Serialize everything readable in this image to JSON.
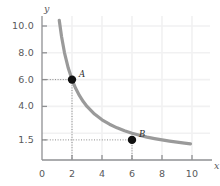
{
  "chart_data": {
    "type": "line",
    "title": "",
    "subtitle": "",
    "xlabel": "x",
    "ylabel": "y",
    "xlim": [
      0,
      10
    ],
    "ylim": [
      0,
      10.6
    ],
    "grid": true,
    "legend": "none",
    "curve": {
      "name": "hyperbola",
      "equation": "y = 12 / x",
      "color": "#9a9a9a",
      "width": 3.2,
      "x_start": 1.15,
      "x_end": 9.9,
      "points_x": [
        1.15,
        1.3,
        1.5,
        1.75,
        2.0,
        2.25,
        2.5,
        2.75,
        3.0,
        3.5,
        4.0,
        4.5,
        5.0,
        5.5,
        6.0,
        6.5,
        7.0,
        7.5,
        8.0,
        8.5,
        9.0,
        9.5,
        9.9
      ],
      "points_y": [
        10.43,
        9.23,
        8.0,
        6.86,
        6.0,
        5.33,
        4.8,
        4.36,
        4.0,
        3.43,
        3.0,
        2.67,
        2.4,
        2.18,
        2.0,
        1.85,
        1.71,
        1.6,
        1.5,
        1.41,
        1.33,
        1.26,
        1.21
      ]
    },
    "x_ticks": [
      {
        "value": 0,
        "label": "0"
      },
      {
        "value": 2,
        "label": "2"
      },
      {
        "value": 4,
        "label": "4"
      },
      {
        "value": 6,
        "label": "6"
      },
      {
        "value": 8,
        "label": "8"
      },
      {
        "value": 10,
        "label": "10"
      }
    ],
    "y_ticks": [
      {
        "value": 10.0,
        "label": "10.0"
      },
      {
        "value": 8.0,
        "label": "8.0"
      },
      {
        "value": 6.0,
        "label": "6.0"
      },
      {
        "value": 4.0,
        "label": "4.0"
      },
      {
        "value": 1.5,
        "label": "1.5"
      }
    ],
    "points": [
      {
        "label": "A",
        "x": 2.0,
        "y": 6.0,
        "color": "#111111",
        "radius": 4.2,
        "label_dx": 7,
        "label_dy": -11,
        "guides": true
      },
      {
        "label": "B",
        "x": 6.0,
        "y": 1.5,
        "color": "#111111",
        "radius": 4.2,
        "label_dx": 7,
        "label_dy": -11,
        "guides": true
      }
    ],
    "annotations": [],
    "axis_color": "#8f9093",
    "grid_color": "#f1f1f2",
    "guide_color": "#8a8a8a",
    "text_color": "#58595b"
  },
  "figure": {
    "x_axis_name": "x",
    "y_axis_name": "y",
    "background": "#ffffff"
  }
}
